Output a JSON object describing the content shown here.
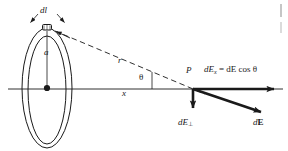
{
  "figure": {
    "type": "physics-diagram",
    "background_color": "#ffffff",
    "ink_color": "#1a1a1a",
    "labels": {
      "dl": "dl",
      "radius": "a",
      "distance": "r",
      "angle": "θ",
      "axis_distance": "x",
      "point": "P",
      "equation_lhs": "dE",
      "equation_lhs_sub": "x",
      "equation_rhs": "= dE cos θ",
      "perp_component": "dE",
      "perp_component_sub": "⊥",
      "resultant_d": "d",
      "resultant_E": "E",
      "page_edge": ""
    },
    "geometry": {
      "ring_center": [
        47,
        88
      ],
      "ring_outer_rx": 25,
      "ring_outer_ry": 60,
      "ring_inner_rx": 19,
      "ring_inner_ry": 54,
      "dl_element": [
        47,
        28
      ],
      "point_P": [
        193,
        89
      ],
      "axis_y": 89,
      "axis_x_start": 8,
      "axis_x_end": 283
    },
    "vectors": [
      {
        "name": "dE_x",
        "label": "dEₓ = dE cos θ",
        "from": [
          193,
          89
        ],
        "to": [
          281,
          89
        ],
        "direction": "horizontal-right",
        "meaning": "axial component of dE"
      },
      {
        "name": "dE_perp",
        "label": "dE⊥",
        "from": [
          193,
          89
        ],
        "to": [
          193,
          114
        ],
        "direction": "vertical-down",
        "meaning": "perpendicular component of dE"
      },
      {
        "name": "dE",
        "label": "dE",
        "from": [
          193,
          89
        ],
        "to": [
          268,
          115
        ],
        "direction": "diagonal-down-right",
        "meaning": "resultant field from charge element dl"
      }
    ],
    "lines": [
      {
        "name": "axis-line",
        "style": "solid-thin",
        "meaning": "x axis through ring center and P"
      },
      {
        "name": "r-line",
        "style": "dashed",
        "meaning": "distance r from dl element to P"
      },
      {
        "name": "a-line",
        "style": "solid-thin",
        "meaning": "ring radius a from center to dl"
      }
    ]
  }
}
